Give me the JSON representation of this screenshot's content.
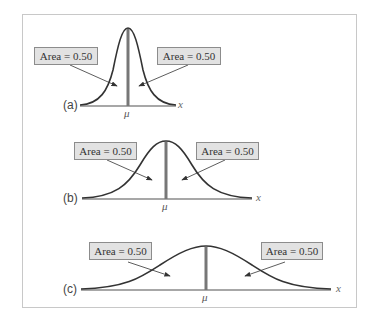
{
  "figure": {
    "panels": [
      {
        "id": "a",
        "label": "(a)",
        "left_area_label": "Area = 0.50",
        "right_area_label": "Area = 0.50",
        "mean_label": "μ",
        "axis_label": "x",
        "spread": "small"
      },
      {
        "id": "b",
        "label": "(b)",
        "left_area_label": "Area = 0.50",
        "right_area_label": "Area = 0.50",
        "mean_label": "μ",
        "axis_label": "x",
        "spread": "medium"
      },
      {
        "id": "c",
        "label": "(c)",
        "left_area_label": "Area = 0.50",
        "right_area_label": "Area = 0.50",
        "mean_label": "μ",
        "axis_label": "x",
        "spread": "large"
      }
    ],
    "colors": {
      "curve": "#333333",
      "mean_line": "#777777",
      "baseline": "#8a8a8a",
      "box_fill": "#e2e2e2",
      "box_border": "#8c8c8c",
      "frame": "#c8c8c8"
    }
  }
}
